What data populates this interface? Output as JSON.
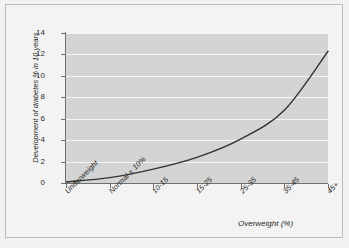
{
  "chart_data": {
    "type": "line",
    "title": "",
    "xlabel": "Overweight (%)",
    "ylabel": "Development of diabetes % in 10 years",
    "categories": [
      "Underweight",
      "Normal ± 10%",
      "10-15",
      "15-25",
      "25-35",
      "35-45",
      "45+"
    ],
    "xticklabels": [
      "Underweight",
      "Normal ± 10%",
      "10-15",
      "15-25",
      "25-35",
      "35-45",
      "45+"
    ],
    "yticklabels": [
      "0",
      "2",
      "4",
      "6",
      "8",
      "10",
      "12",
      "14"
    ],
    "yticks": [
      0,
      2,
      4,
      6,
      8,
      10,
      12,
      14
    ],
    "ylim": [
      0,
      14
    ],
    "xlim": [
      0,
      6
    ],
    "grid": "horizontal-white",
    "legend": "none",
    "series": [
      {
        "name": "Development of diabetes % in 10 years",
        "x": [
          0,
          1,
          2,
          3,
          4,
          5,
          6
        ],
        "values": [
          0.1,
          0.5,
          1.3,
          2.4,
          4.1,
          6.8,
          12.3
        ],
        "color": "#333333"
      }
    ],
    "plot_background": "#d4d4d4",
    "figure_background": "#f3f3f3",
    "gridline_color": "#f4f4f4",
    "axis_color": "#6f6f6f"
  },
  "axes": {
    "y_title": "Development of diabetes % in 10 years",
    "x_title": "Overweight (%)",
    "y_ticks": [
      {
        "label": "14",
        "value": 14
      },
      {
        "label": "12",
        "value": 12
      },
      {
        "label": "10",
        "value": 10
      },
      {
        "label": "8",
        "value": 8
      },
      {
        "label": "6",
        "value": 6
      },
      {
        "label": "4",
        "value": 4
      },
      {
        "label": "2",
        "value": 2
      },
      {
        "label": "0",
        "value": 0
      }
    ],
    "x_ticks": [
      {
        "label": "Underweight",
        "index": 0
      },
      {
        "label": "Normal ± 10%",
        "index": 1
      },
      {
        "label": "10-15",
        "index": 2
      },
      {
        "label": "15-25",
        "index": 3
      },
      {
        "label": "25-35",
        "index": 4
      },
      {
        "label": "35-45",
        "index": 5
      },
      {
        "label": "45+",
        "index": 6
      }
    ]
  }
}
